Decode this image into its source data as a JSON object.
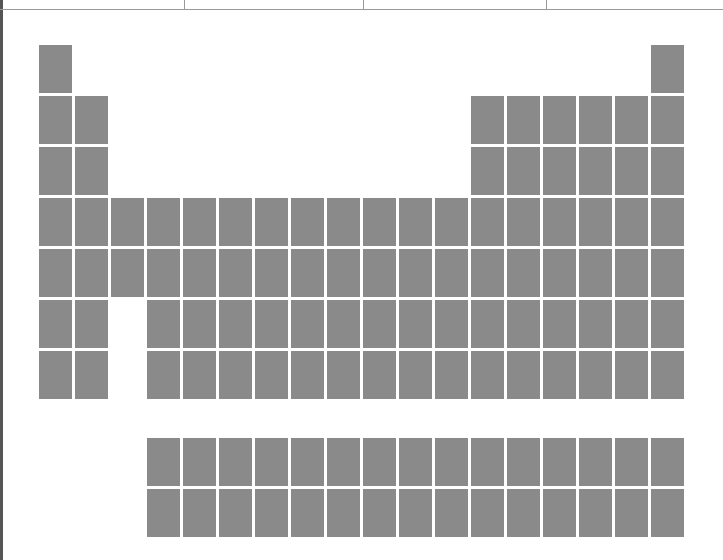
{
  "diagram": {
    "type": "periodic-table-blank",
    "colors": {
      "cell": "#8a8a8a",
      "background": "#ffffff"
    },
    "grid": {
      "columns": 18,
      "main_rows": 7,
      "f_block_rows": 2,
      "origin_x": 39,
      "origin_y": 45,
      "pitch_x": 36,
      "pitch_y": 51,
      "f_block_origin_y": 438
    },
    "header_dividers": [
      184,
      363,
      546
    ],
    "rows": [
      [
        1,
        18
      ],
      [
        1,
        2,
        13,
        14,
        15,
        16,
        17,
        18
      ],
      [
        1,
        2,
        13,
        14,
        15,
        16,
        17,
        18
      ],
      [
        1,
        2,
        3,
        4,
        5,
        6,
        7,
        8,
        9,
        10,
        11,
        12,
        13,
        14,
        15,
        16,
        17,
        18
      ],
      [
        1,
        2,
        3,
        4,
        5,
        6,
        7,
        8,
        9,
        10,
        11,
        12,
        13,
        14,
        15,
        16,
        17,
        18
      ],
      [
        1,
        2,
        4,
        5,
        6,
        7,
        8,
        9,
        10,
        11,
        12,
        13,
        14,
        15,
        16,
        17,
        18
      ],
      [
        1,
        2,
        4,
        5,
        6,
        7,
        8,
        9,
        10,
        11,
        12,
        13,
        14,
        15,
        16,
        17,
        18
      ]
    ],
    "f_block_rows": [
      [
        4,
        5,
        6,
        7,
        8,
        9,
        10,
        11,
        12,
        13,
        14,
        15,
        16,
        17,
        18
      ],
      [
        4,
        5,
        6,
        7,
        8,
        9,
        10,
        11,
        12,
        13,
        14,
        15,
        16,
        17,
        18
      ]
    ]
  }
}
